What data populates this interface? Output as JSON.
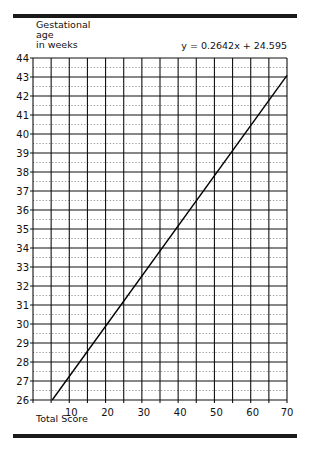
{
  "chart_data": {
    "type": "line",
    "title": "",
    "ylabel": "Gestational age in weeks",
    "xlabel": "Total Score",
    "annotation": "y = 0.2642x + 24.595",
    "xlim": [
      0,
      70
    ],
    "ylim": [
      26,
      44
    ],
    "x_ticks": [
      10,
      20,
      30,
      40,
      50,
      60,
      70
    ],
    "y_ticks": [
      26,
      27,
      28,
      29,
      30,
      31,
      32,
      33,
      34,
      35,
      36,
      37,
      38,
      39,
      40,
      41,
      42,
      43,
      44
    ],
    "grid": {
      "major_x_every": 5,
      "major_y_every": 1,
      "minor_y_dotted_every": 0.5
    },
    "series": [
      {
        "name": "regression",
        "slope": 0.2642,
        "intercept": 24.595,
        "x": [
          5.3,
          70
        ],
        "y": [
          26.0,
          43.09
        ]
      }
    ]
  },
  "labels": {
    "ytitle_line1": "Gestational",
    "ytitle_line2": "age",
    "ytitle_line3": "in weeks",
    "equation": "y = 0.2642x + 24.595",
    "xtitle": "Total Score"
  }
}
